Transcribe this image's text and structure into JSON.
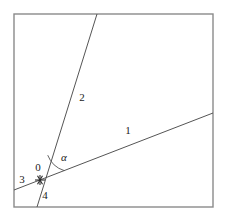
{
  "figure": {
    "background_color": "#ffffff",
    "frame": {
      "name": "plot-frame",
      "stroke_color": "#8a8a8a",
      "x": 14,
      "y": 14,
      "width": 199,
      "height": 193
    },
    "vertex": {
      "label": "0",
      "marker": "asterisk-marker",
      "x": 40,
      "y": 180,
      "label_x": 38,
      "label_y": 168
    },
    "angle": {
      "symbol": "α",
      "label_x": 64,
      "label_y": 158,
      "arc_radius": 26,
      "arc_color": "#555555"
    },
    "lines": [
      {
        "name": "line-1",
        "label": "1",
        "label_x": 128,
        "label_y": 131,
        "x1": 14,
        "y1": 190,
        "x2": 213,
        "y2": 113,
        "color": "#555555"
      },
      {
        "name": "line-2",
        "label": "2",
        "label_x": 82,
        "label_y": 98,
        "x1": 37,
        "y1": 207,
        "x2": 97,
        "y2": 14,
        "color": "#555555"
      }
    ],
    "ray_labels": [
      {
        "name": "ray-label-3",
        "label": "3",
        "x": 22,
        "y": 180
      },
      {
        "name": "ray-label-4",
        "label": "4",
        "x": 45,
        "y": 196
      }
    ]
  }
}
